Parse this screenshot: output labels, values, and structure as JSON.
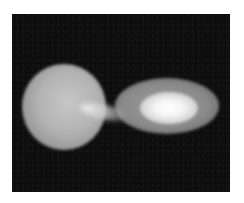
{
  "image": {
    "description": "Grayscale rendering of a binary star system: a large diffuse donor star on the left transferring mass via a bright stream to an elliptical accretion disk with a bright white core on the right, on a dark noisy background inside a white border.",
    "background_color": "#0d0d0d",
    "border_color": "#ffffff",
    "elements": [
      {
        "name": "donor-star",
        "color": "#b3b3b3"
      },
      {
        "name": "mass-transfer-stream",
        "color": "#f0f0f0"
      },
      {
        "name": "accretion-disk",
        "color": "#8a8a8a"
      },
      {
        "name": "disk-core",
        "color": "#ffffff"
      }
    ]
  }
}
